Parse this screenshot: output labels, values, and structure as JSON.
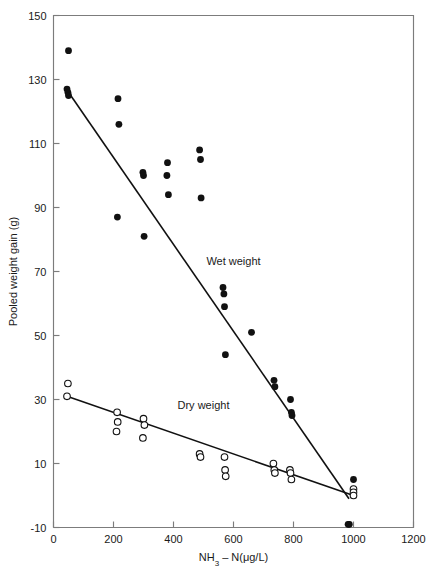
{
  "chart_data": {
    "type": "scatter",
    "title": "",
    "xlabel": "NH3 − N(μg/L)",
    "ylabel": "Pooled weight gain (g)",
    "xlim": [
      0,
      1200
    ],
    "ylim": [
      -10,
      150
    ],
    "xticks": [
      0,
      200,
      400,
      600,
      800,
      1000,
      1200
    ],
    "yticks": [
      -10,
      10,
      30,
      50,
      70,
      90,
      110,
      130,
      150
    ],
    "grid": false,
    "legend_position": "inline-annotations",
    "series": [
      {
        "name": "Wet weight",
        "marker": "filled-circle",
        "color": "#111111",
        "label_x": 600,
        "label_y": 72,
        "points": [
          [
            50,
            139
          ],
          [
            45,
            127
          ],
          [
            48,
            126
          ],
          [
            50,
            125
          ],
          [
            215,
            124
          ],
          [
            218,
            116
          ],
          [
            213,
            87
          ],
          [
            298,
            101
          ],
          [
            300,
            100
          ],
          [
            302,
            81
          ],
          [
            380,
            104
          ],
          [
            378,
            100
          ],
          [
            383,
            94
          ],
          [
            487,
            108
          ],
          [
            490,
            105
          ],
          [
            492,
            93
          ],
          [
            565,
            65
          ],
          [
            568,
            63
          ],
          [
            570,
            59
          ],
          [
            573,
            44
          ],
          [
            660,
            51
          ],
          [
            735,
            36
          ],
          [
            738,
            34
          ],
          [
            790,
            30
          ],
          [
            793,
            26
          ],
          [
            795,
            25
          ],
          [
            982,
            -9
          ],
          [
            986,
            -9
          ],
          [
            1000,
            5
          ]
        ]
      },
      {
        "name": "Dry weight",
        "marker": "open-circle",
        "color": "#111111",
        "label_x": 500,
        "label_y": 27,
        "points": [
          [
            48,
            35
          ],
          [
            45,
            31
          ],
          [
            212,
            26
          ],
          [
            214,
            23
          ],
          [
            210,
            20
          ],
          [
            300,
            24
          ],
          [
            303,
            22
          ],
          [
            298,
            18
          ],
          [
            487,
            13
          ],
          [
            490,
            12
          ],
          [
            570,
            12
          ],
          [
            572,
            8
          ],
          [
            574,
            6
          ],
          [
            733,
            10
          ],
          [
            736,
            8
          ],
          [
            738,
            7
          ],
          [
            788,
            8
          ],
          [
            790,
            7
          ],
          [
            793,
            5
          ],
          [
            1000,
            2
          ],
          [
            1000,
            1
          ],
          [
            1000,
            0
          ]
        ]
      }
    ],
    "fit_lines": [
      {
        "name": "Wet weight fit",
        "x0": 50,
        "y0": 126,
        "x1": 985,
        "y1": -1
      },
      {
        "name": "Dry weight fit",
        "x0": 45,
        "y0": 31,
        "x1": 1000,
        "y1": 0
      }
    ]
  },
  "axes": {
    "x_title": "NH3 − N(μg/L)",
    "x_title_parts": {
      "prefix": "NH",
      "subscript": "3",
      "suffix": "– N(μg/L)"
    },
    "y_title": "Pooled weight gain (g)",
    "x_tick_labels": [
      "0",
      "200",
      "400",
      "600",
      "800",
      "1000",
      "1200"
    ],
    "y_tick_labels": [
      "-10",
      "10",
      "30",
      "50",
      "70",
      "90",
      "110",
      "130",
      "150"
    ]
  },
  "annotations": {
    "wet_weight_label": "Wet weight",
    "dry_weight_label": "Dry weight"
  },
  "colors": {
    "frame": "#7c7c7c",
    "marker_filled": "#111111",
    "marker_open_stroke": "#111111",
    "marker_open_fill": "#ffffff",
    "fit_line": "#111111",
    "text": "#1a1a1a",
    "background": "#ffffff"
  }
}
